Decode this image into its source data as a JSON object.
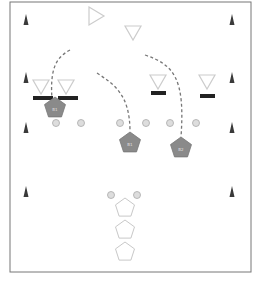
{
  "diagram": {
    "type": "soccer-drill",
    "colors": {
      "frame": "#777777",
      "cone": "#3a3a3a",
      "player_fill": "#8a8a8a",
      "player_outline_light": "#c8c8c8",
      "path": "#777777",
      "ball": "#dddddd",
      "goal_bar": "#222222",
      "triangle_outline": "#cccccc"
    },
    "frame": {
      "x": 10,
      "y": 2,
      "w": 241,
      "h": 270
    },
    "cones": [
      {
        "x": 26,
        "y": 20
      },
      {
        "x": 232,
        "y": 20
      },
      {
        "x": 26,
        "y": 78
      },
      {
        "x": 232,
        "y": 78
      },
      {
        "x": 26,
        "y": 128
      },
      {
        "x": 232,
        "y": 128
      },
      {
        "x": 26,
        "y": 192
      },
      {
        "x": 232,
        "y": 192
      }
    ],
    "triangles": [
      {
        "x": 96,
        "y": 16,
        "dir": "right"
      },
      {
        "x": 133,
        "y": 33,
        "dir": "down"
      },
      {
        "x": 41,
        "y": 87,
        "dir": "down"
      },
      {
        "x": 66,
        "y": 87,
        "dir": "down"
      },
      {
        "x": 158,
        "y": 82,
        "dir": "down"
      },
      {
        "x": 207,
        "y": 82,
        "dir": "down"
      }
    ],
    "goal_bars": [
      {
        "x": 33,
        "y": 96,
        "w": 20
      },
      {
        "x": 58,
        "y": 96,
        "w": 20
      },
      {
        "x": 151,
        "y": 91,
        "w": 15
      },
      {
        "x": 200,
        "y": 94,
        "w": 15
      }
    ],
    "players_filled": [
      {
        "x": 55,
        "y": 108,
        "label": "B1"
      },
      {
        "x": 130,
        "y": 143,
        "label": "B1"
      },
      {
        "x": 181,
        "y": 148,
        "label": "B2"
      }
    ],
    "players_outline": [
      {
        "x": 125,
        "y": 208
      },
      {
        "x": 125,
        "y": 230
      },
      {
        "x": 125,
        "y": 252
      }
    ],
    "balls": [
      {
        "x": 56,
        "y": 123
      },
      {
        "x": 81,
        "y": 123
      },
      {
        "x": 120,
        "y": 123
      },
      {
        "x": 146,
        "y": 123
      },
      {
        "x": 170,
        "y": 123
      },
      {
        "x": 196,
        "y": 123
      },
      {
        "x": 111,
        "y": 195
      },
      {
        "x": 137,
        "y": 195
      }
    ],
    "paths": [
      "M70 50 C 55 58, 50 70, 52 100",
      "M97 73 C 115 85, 130 95, 130 132",
      "M145 55 C 175 65, 185 80, 181 137"
    ]
  }
}
